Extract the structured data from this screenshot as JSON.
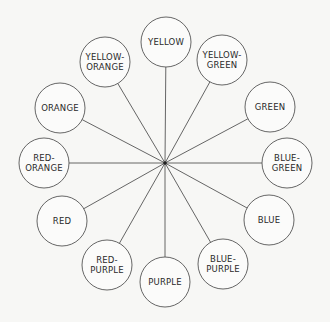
{
  "diagram": {
    "type": "color-wheel",
    "hub": {
      "x": 165,
      "y": 163
    },
    "radius": 25,
    "nodes": [
      {
        "id": "yellow",
        "lines": [
          "YELLOW"
        ],
        "x": 166,
        "y": 42
      },
      {
        "id": "yellow-green",
        "lines": [
          "YELLOW-",
          "GREEN"
        ],
        "x": 222,
        "y": 60
      },
      {
        "id": "green",
        "lines": [
          "GREEN"
        ],
        "x": 270,
        "y": 107
      },
      {
        "id": "blue-green",
        "lines": [
          "BLUE-",
          "GREEN"
        ],
        "x": 287,
        "y": 163
      },
      {
        "id": "blue",
        "lines": [
          "BLUE"
        ],
        "x": 269,
        "y": 220
      },
      {
        "id": "blue-purple",
        "lines": [
          "BLUE-",
          "PURPLE"
        ],
        "x": 223,
        "y": 264
      },
      {
        "id": "purple",
        "lines": [
          "PURPLE"
        ],
        "x": 165,
        "y": 282
      },
      {
        "id": "red-purple",
        "lines": [
          "RED-",
          "PURPLE"
        ],
        "x": 107,
        "y": 265
      },
      {
        "id": "red",
        "lines": [
          "RED"
        ],
        "x": 62,
        "y": 221
      },
      {
        "id": "red-orange",
        "lines": [
          "RED-",
          "ORANGE"
        ],
        "x": 44,
        "y": 163
      },
      {
        "id": "orange",
        "lines": [
          "ORANGE"
        ],
        "x": 60,
        "y": 108
      },
      {
        "id": "yellow-orange",
        "lines": [
          "YELLOW-",
          "ORANGE"
        ],
        "x": 105,
        "y": 62
      }
    ]
  }
}
